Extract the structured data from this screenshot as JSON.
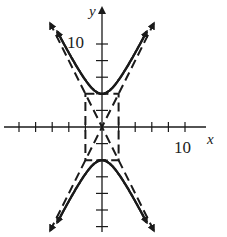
{
  "chart_data": {
    "type": "line",
    "title": "",
    "xlabel": "x",
    "ylabel": "y",
    "xlim": [
      -12,
      14
    ],
    "ylim": [
      -13,
      15
    ],
    "grid": false,
    "x_tick_step": 2,
    "y_tick_step": 2,
    "tick_labels": {
      "x": [
        "10"
      ],
      "y": [
        "10"
      ]
    },
    "series": [
      {
        "name": "hyperbola",
        "equation": "y^2/16 - x^2/4 = 1",
        "style": "solid",
        "vertices": [
          [
            0,
            4
          ],
          [
            0,
            -4
          ]
        ]
      },
      {
        "name": "asymptote-1",
        "equation": "y = 2x",
        "style": "dashed"
      },
      {
        "name": "asymptote-2",
        "equation": "y = -2x",
        "style": "dashed"
      },
      {
        "name": "fundamental-rectangle",
        "corners": [
          [
            -2,
            4
          ],
          [
            2,
            4
          ],
          [
            2,
            -4
          ],
          [
            -2,
            -4
          ]
        ],
        "style": "dashed"
      }
    ]
  },
  "axes": {
    "x_label": "x",
    "y_label": "y",
    "x_tick_label": "10",
    "y_tick_label": "10"
  },
  "colors": {
    "ink": "#1a1a1a",
    "background": "#ffffff"
  }
}
